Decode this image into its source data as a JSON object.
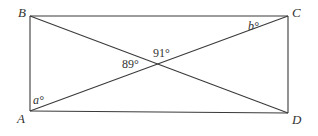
{
  "diagram": {
    "type": "rectangle-with-diagonals",
    "vertices": {
      "A": {
        "label": "A"
      },
      "B": {
        "label": "B"
      },
      "C": {
        "label": "C"
      },
      "D": {
        "label": "D"
      }
    },
    "angles": {
      "a": "a°",
      "b": "b°",
      "left_intersection": "89°",
      "top_intersection": "91°"
    },
    "line_color": "#3a3a3a"
  }
}
